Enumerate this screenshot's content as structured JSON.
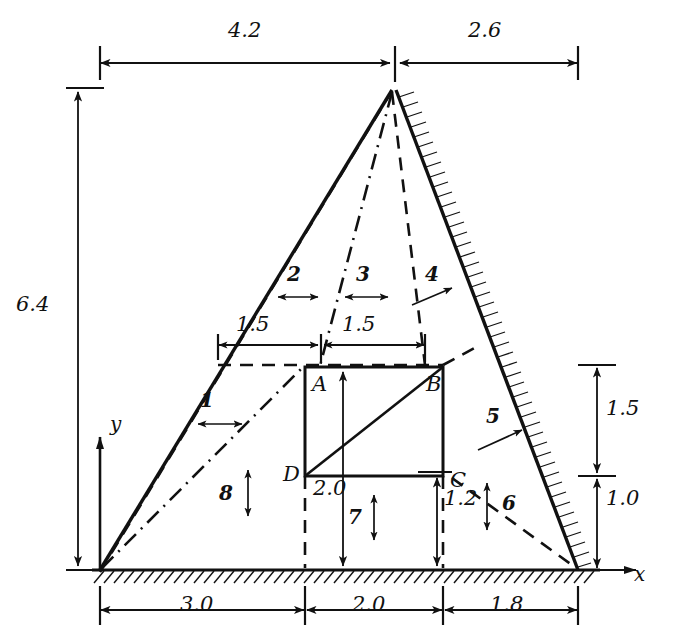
{
  "figure": {
    "type": "engineering-mesh-diagram",
    "ink_color": "#111111",
    "background_color": "#ffffff"
  },
  "axes": {
    "x_label": "x",
    "y_label": "y"
  },
  "nodes": [
    {
      "name": "A",
      "x": 305,
      "y": 367
    },
    {
      "name": "B",
      "x": 443,
      "y": 367
    },
    {
      "name": "C",
      "x": 443,
      "y": 476
    },
    {
      "name": "D",
      "x": 305,
      "y": 476
    }
  ],
  "dimensions": {
    "top": [
      {
        "value": "4.2",
        "x1": 100,
        "x2": 392,
        "y": 63,
        "label_x": 240,
        "label_y": 30
      },
      {
        "value": "2.6",
        "x1": 398,
        "x2": 578,
        "y": 63,
        "label_x": 480,
        "label_y": 30
      }
    ],
    "left": [
      {
        "value": "6.4",
        "y1": 90,
        "y2": 570,
        "x": 78,
        "label_x": 22,
        "label_y": 305
      }
    ],
    "bottom": [
      {
        "value": "3.0",
        "x1": 100,
        "x2": 305,
        "y": 610,
        "label_x": 190,
        "label_y": 578
      },
      {
        "value": "2.0",
        "x1": 305,
        "x2": 443,
        "y": 610,
        "label_x": 360,
        "label_y": 578
      },
      {
        "value": "1.8",
        "x1": 443,
        "x2": 578,
        "y": 610,
        "label_x": 495,
        "label_y": 578
      }
    ],
    "right": [
      {
        "value": "1.5",
        "y1": 367,
        "y2": 476,
        "x": 597,
        "label_x": 608,
        "label_y": 408
      },
      {
        "value": "1.0",
        "y1": 476,
        "y2": 570,
        "x": 597,
        "label_x": 608,
        "label_y": 500
      }
    ],
    "inner_horizontal": [
      {
        "value": "1.5",
        "x1": 218,
        "x2": 320,
        "y": 345,
        "label_x": 243,
        "label_y": 315
      },
      {
        "value": "1.5",
        "x1": 322,
        "x2": 425,
        "y": 345,
        "label_x": 348,
        "label_y": 315
      }
    ],
    "inner_vertical": [
      {
        "value": "2.0",
        "x": 343,
        "y1": 372,
        "y2": 568,
        "label_x": 320,
        "label_y": 482
      },
      {
        "value": "1.2",
        "x": 437,
        "y1": 478,
        "y2": 568,
        "label_x": 448,
        "label_y": 492
      }
    ]
  },
  "elements": [
    {
      "number": "1",
      "label_x": 205,
      "label_y": 400,
      "arrow": "horizontal",
      "ax": 213,
      "ay": 424
    },
    {
      "number": "2",
      "label_x": 288,
      "label_y": 272,
      "arrow": "horizontal",
      "ax": 296,
      "ay": 297
    },
    {
      "number": "3",
      "label_x": 355,
      "label_y": 272,
      "arrow": "horizontal",
      "ax": 363,
      "ay": 297
    },
    {
      "number": "4",
      "label_x": 425,
      "label_y": 272,
      "arrow": "diagonal-ne",
      "ax": 433,
      "ay": 297
    },
    {
      "number": "5",
      "label_x": 490,
      "label_y": 415,
      "arrow": "diagonal-ne",
      "ax": 498,
      "ay": 440
    },
    {
      "number": "6",
      "label_x": 505,
      "label_y": 500,
      "arrow": "vertical",
      "ax": 487,
      "ay": 512
    },
    {
      "number": "7",
      "label_x": 352,
      "label_y": 520,
      "arrow": "vertical",
      "ax": 374,
      "ay": 517
    },
    {
      "number": "8",
      "label_x": 222,
      "label_y": 495,
      "arrow": "vertical",
      "ax": 248,
      "ay": 492
    }
  ],
  "geometry": {
    "apex": {
      "x": 392,
      "y": 90
    },
    "left_base": {
      "x": 100,
      "y": 570
    },
    "right_base": {
      "x": 578,
      "y": 570
    },
    "ground_y": 570,
    "hatched_edges": [
      "right-slope",
      "base"
    ]
  }
}
